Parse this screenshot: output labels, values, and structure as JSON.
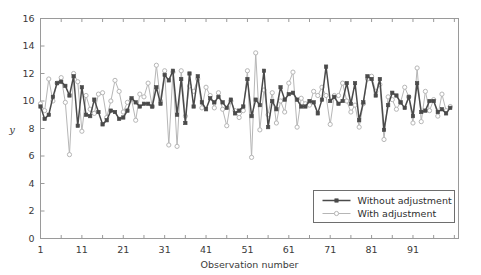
{
  "chart_data": {
    "type": "line",
    "title": "",
    "xlabel": "Observation number",
    "ylabel": "y",
    "xlim": [
      1,
      102
    ],
    "ylim": [
      0,
      16
    ],
    "xticks": [
      1,
      11,
      21,
      31,
      41,
      51,
      61,
      71,
      81,
      91
    ],
    "xtick_labels": [
      "1",
      "11",
      "21",
      "31",
      "41",
      "51",
      "61",
      "71",
      "81",
      "91"
    ],
    "yticks": [
      0,
      2,
      4,
      6,
      8,
      10,
      12,
      14,
      16
    ],
    "ytick_labels": [
      "0",
      "2",
      "4",
      "6",
      "8",
      "10",
      "12",
      "14",
      "16"
    ],
    "grid": false,
    "legend_position": "lower right",
    "x": [
      1,
      2,
      3,
      4,
      5,
      6,
      7,
      8,
      9,
      10,
      11,
      12,
      13,
      14,
      15,
      16,
      17,
      18,
      19,
      20,
      21,
      22,
      23,
      24,
      25,
      26,
      27,
      28,
      29,
      30,
      31,
      32,
      33,
      34,
      35,
      36,
      37,
      38,
      39,
      40,
      41,
      42,
      43,
      44,
      45,
      46,
      47,
      48,
      49,
      50,
      51,
      52,
      53,
      54,
      55,
      56,
      57,
      58,
      59,
      60,
      61,
      62,
      63,
      64,
      65,
      66,
      67,
      68,
      69,
      70,
      71,
      72,
      73,
      74,
      75,
      76,
      77,
      78,
      79,
      80,
      81,
      82,
      83,
      84,
      85,
      86,
      87,
      88,
      89,
      90,
      91,
      92,
      93,
      94,
      95,
      96,
      97,
      98,
      99,
      100
    ],
    "series": [
      {
        "name": "Without adjustment",
        "color": "#4a4a4a",
        "marker": "filled-square",
        "linewidth": 1.5,
        "values": [
          9.6,
          8.7,
          9.0,
          10.3,
          11.3,
          11.4,
          11.1,
          10.4,
          11.8,
          8.2,
          11.0,
          9.0,
          8.9,
          10.1,
          9.2,
          8.3,
          8.6,
          9.3,
          9.2,
          8.7,
          8.8,
          9.3,
          10.2,
          9.9,
          9.6,
          9.8,
          9.8,
          9.6,
          11.0,
          9.8,
          11.9,
          11.5,
          12.2,
          9.0,
          11.6,
          8.4,
          12.0,
          9.6,
          11.8,
          9.9,
          9.4,
          10.2,
          9.9,
          10.3,
          9.9,
          9.5,
          10.1,
          9.1,
          9.3,
          9.6,
          11.6,
          8.9,
          10.1,
          9.7,
          12.2,
          8.1,
          10.0,
          9.4,
          11.0,
          10.1,
          10.5,
          10.6,
          10.1,
          9.6,
          9.6,
          10.0,
          9.9,
          9.1,
          10.1,
          12.5,
          10.0,
          10.3,
          9.8,
          10.0,
          11.3,
          9.8,
          11.3,
          8.6,
          9.9,
          11.8,
          11.6,
          10.4,
          11.6,
          7.9,
          9.7,
          10.6,
          10.4,
          9.9,
          9.5,
          10.3,
          8.9,
          11.3,
          9.2,
          9.3,
          10.0,
          10.0,
          9.2,
          9.4,
          9.1,
          9.5
        ]
      },
      {
        "name": "With adjustment",
        "color": "#b6b6b6",
        "marker": "open-circle",
        "linewidth": 1.0,
        "values": [
          9.8,
          9.3,
          11.6,
          10.0,
          11.3,
          11.7,
          9.9,
          6.1,
          12.0,
          11.4,
          7.8,
          10.4,
          9.4,
          9.1,
          10.5,
          10.6,
          8.8,
          10.0,
          11.5,
          10.7,
          9.2,
          9.9,
          10.1,
          8.6,
          10.5,
          10.3,
          11.3,
          9.6,
          12.6,
          10.0,
          12.2,
          6.8,
          12.1,
          6.7,
          12.2,
          8.9,
          11.1,
          10.7,
          11.6,
          9.5,
          11.0,
          10.4,
          9.5,
          10.6,
          9.4,
          8.2,
          10.0,
          9.3,
          8.8,
          9.3,
          12.2,
          5.9,
          13.5,
          7.9,
          10.8,
          9.0,
          10.6,
          8.4,
          10.0,
          9.2,
          11.3,
          12.1,
          8.1,
          10.2,
          9.8,
          9.7,
          10.7,
          10.4,
          11.0,
          10.4,
          8.3,
          10.4,
          10.4,
          11.3,
          10.0,
          9.2,
          9.7,
          8.1,
          9.8,
          11.6,
          11.8,
          10.7,
          11.2,
          7.2,
          10.3,
          10.1,
          9.4,
          9.9,
          11.0,
          10.3,
          8.4,
          12.4,
          8.5,
          10.7,
          9.3,
          10.1,
          8.9,
          10.5,
          9.3,
          9.6
        ]
      }
    ]
  },
  "legend": {
    "entries": [
      {
        "label": "Without adjustment"
      },
      {
        "label": "With adjustment"
      }
    ]
  },
  "style": {
    "axis_color": "#9a9a9a",
    "text_color": "#3a3a3a",
    "series1_color": "#4a4a4a",
    "series2_color": "#b6b6b6",
    "background": "#ffffff"
  }
}
